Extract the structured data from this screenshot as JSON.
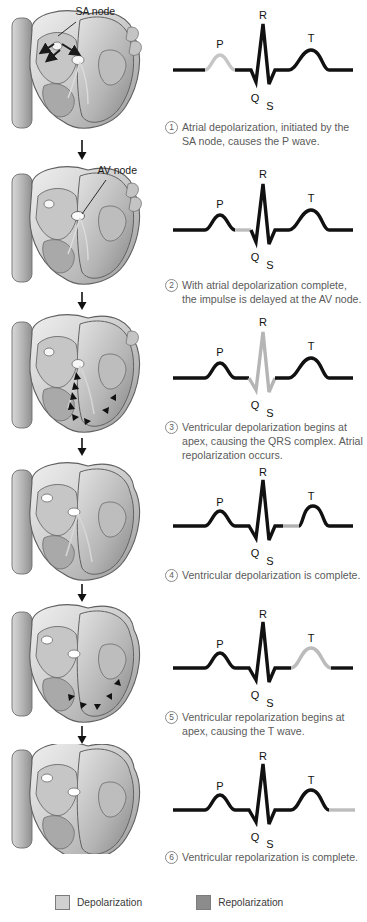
{
  "diagram": {
    "colors": {
      "trace_dark": "#111111",
      "trace_highlight": "#b9b9b9",
      "depolarization_swatch": "#d0d0d0",
      "repolarization_swatch": "#8c8c8c",
      "caption_text": "#5b5b5b",
      "label_text": "#111111"
    }
  },
  "wave_labels": {
    "p": "P",
    "q": "Q",
    "r": "R",
    "s": "S",
    "t": "T"
  },
  "steps": [
    {
      "number": "1",
      "heart_label": "SA node",
      "has_heart_label": true,
      "caption": "Atrial depolarization, initiated by the SA node, causes the P wave.",
      "highlight_segment": "p-wave",
      "highlight_color": "#c6c6c6"
    },
    {
      "number": "2",
      "heart_label": "AV node",
      "has_heart_label": true,
      "caption": "With atrial depolarization complete, the impulse is delayed at the AV node.",
      "highlight_segment": "pr-segment",
      "highlight_color": "#bdbdbd"
    },
    {
      "number": "3",
      "heart_label": "",
      "has_heart_label": false,
      "caption": "Ventricular depolarization begins at apex, causing the QRS complex. Atrial repolarization occurs.",
      "highlight_segment": "qrs-complex",
      "highlight_color": "#b5b5b5"
    },
    {
      "number": "4",
      "heart_label": "",
      "has_heart_label": false,
      "caption": "Ventricular depolarization is complete.",
      "highlight_segment": "st-segment",
      "highlight_color": "#b0b0b0"
    },
    {
      "number": "5",
      "heart_label": "",
      "has_heart_label": false,
      "caption": "Ventricular repolarization begins at apex, causing the T wave.",
      "highlight_segment": "t-wave",
      "highlight_color": "#bcbcbc"
    },
    {
      "number": "6",
      "heart_label": "",
      "has_heart_label": false,
      "caption": "Ventricular repolarization is complete.",
      "highlight_segment": "tail-baseline",
      "highlight_color": "#bcbcbc"
    }
  ],
  "legend": {
    "depolarization": "Depolarization",
    "repolarization": "Repolarization"
  }
}
